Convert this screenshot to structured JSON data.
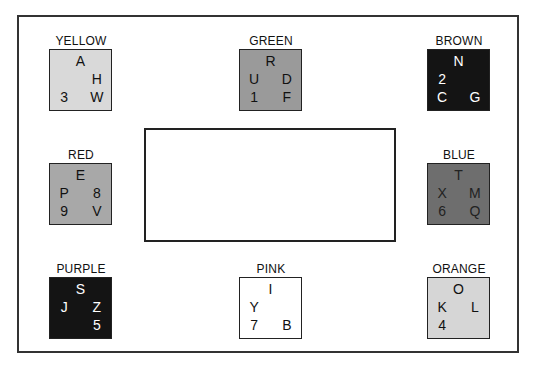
{
  "colors": {
    "frame": "#333333",
    "light": "#d9d9d9",
    "mid": "#a6a6a6",
    "midgreen": "#999999",
    "dark": "#6a6a6a",
    "black": "#141414",
    "white": "#ffffff"
  },
  "groups": [
    {
      "name": "YELLOW",
      "x": 49,
      "y": 49,
      "fill": "#d9d9d9",
      "text": "#111111",
      "cells": [
        {
          "r": 1,
          "c": 2,
          "t": "A"
        },
        {
          "r": 2,
          "c": 3,
          "t": "H"
        },
        {
          "r": 3,
          "c": 1,
          "t": "3"
        },
        {
          "r": 3,
          "c": 3,
          "t": "W"
        }
      ]
    },
    {
      "name": "GREEN",
      "x": 239,
      "y": 49,
      "fill": "#9a9a9a",
      "text": "#111111",
      "cells": [
        {
          "r": 1,
          "c": 2,
          "t": "R"
        },
        {
          "r": 2,
          "c": 1,
          "t": "U"
        },
        {
          "r": 2,
          "c": 3,
          "t": "D"
        },
        {
          "r": 3,
          "c": 1,
          "t": "1"
        },
        {
          "r": 3,
          "c": 3,
          "t": "F"
        }
      ]
    },
    {
      "name": "BROWN",
      "x": 427,
      "y": 49,
      "fill": "#141414",
      "text": "#ffffff",
      "cells": [
        {
          "r": 1,
          "c": 2,
          "t": "N"
        },
        {
          "r": 2,
          "c": 1,
          "t": "2"
        },
        {
          "r": 3,
          "c": 1,
          "t": "C"
        },
        {
          "r": 3,
          "c": 3,
          "t": "G"
        }
      ]
    },
    {
      "name": "RED",
      "x": 49,
      "y": 163,
      "fill": "#a8a8a8",
      "text": "#111111",
      "cells": [
        {
          "r": 1,
          "c": 2,
          "t": "E"
        },
        {
          "r": 2,
          "c": 1,
          "t": "P"
        },
        {
          "r": 2,
          "c": 3,
          "t": "8"
        },
        {
          "r": 3,
          "c": 1,
          "t": "9"
        },
        {
          "r": 3,
          "c": 3,
          "t": "V"
        }
      ]
    },
    {
      "name": "BLUE",
      "x": 427,
      "y": 163,
      "fill": "#6e6e6e",
      "text": "#222222",
      "cells": [
        {
          "r": 1,
          "c": 2,
          "t": "T"
        },
        {
          "r": 2,
          "c": 1,
          "t": "X"
        },
        {
          "r": 2,
          "c": 3,
          "t": "M"
        },
        {
          "r": 3,
          "c": 1,
          "t": "6"
        },
        {
          "r": 3,
          "c": 3,
          "t": "Q"
        }
      ]
    },
    {
      "name": "PURPLE",
      "x": 49,
      "y": 277,
      "fill": "#141414",
      "text": "#ffffff",
      "cells": [
        {
          "r": 1,
          "c": 2,
          "t": "S"
        },
        {
          "r": 2,
          "c": 1,
          "t": "J"
        },
        {
          "r": 2,
          "c": 3,
          "t": "Z"
        },
        {
          "r": 3,
          "c": 3,
          "t": "5"
        }
      ]
    },
    {
      "name": "PINK",
      "x": 239,
      "y": 277,
      "fill": "#ffffff",
      "text": "#111111",
      "cells": [
        {
          "r": 1,
          "c": 2,
          "t": "I"
        },
        {
          "r": 2,
          "c": 1,
          "t": "Y"
        },
        {
          "r": 3,
          "c": 1,
          "t": "7"
        },
        {
          "r": 3,
          "c": 3,
          "t": "B"
        }
      ]
    },
    {
      "name": "ORANGE",
      "x": 427,
      "y": 277,
      "fill": "#d6d6d6",
      "text": "#111111",
      "cells": [
        {
          "r": 1,
          "c": 2,
          "t": "O"
        },
        {
          "r": 2,
          "c": 1,
          "t": "K"
        },
        {
          "r": 2,
          "c": 3,
          "t": "L"
        },
        {
          "r": 3,
          "c": 1,
          "t": "4"
        }
      ]
    }
  ]
}
